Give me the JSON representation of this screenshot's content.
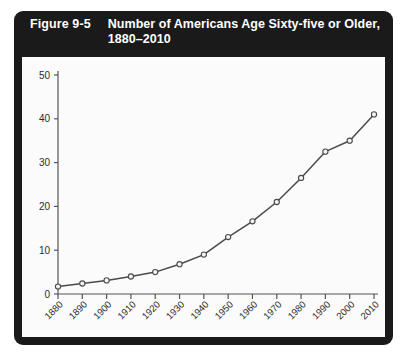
{
  "figure": {
    "number_label": "Figure 9-5",
    "title": "Number of Americans Age Sixty-five or Older, 1880–2010"
  },
  "chart_data": {
    "type": "line",
    "title": "Number of Americans Age Sixty-five or Older, 1880–2010",
    "xlabel": "",
    "ylabel": "",
    "x": [
      1880,
      1890,
      1900,
      1910,
      1920,
      1930,
      1940,
      1950,
      1960,
      1970,
      1980,
      1990,
      2000,
      2010
    ],
    "values": [
      1.7,
      2.4,
      3.1,
      4.0,
      5.0,
      6.8,
      9.0,
      13.0,
      16.6,
      21.0,
      26.5,
      32.5,
      35.0,
      41.0
    ],
    "xtick_labels": [
      "1880",
      "1890",
      "1900",
      "1910",
      "1920",
      "1930",
      "1940",
      "1950",
      "1960",
      "1970",
      "1980",
      "1990",
      "2000",
      "2010"
    ],
    "ytick_labels": [
      "0",
      "10",
      "20",
      "30",
      "40",
      "50"
    ],
    "yticks": [
      0,
      10,
      20,
      30,
      40,
      50
    ],
    "ylim": [
      0,
      50
    ],
    "xlim": [
      1880,
      2010
    ],
    "grid": false,
    "legend": null,
    "marker": "open-circle",
    "line_color": "#4a4a4a",
    "marker_fill": "#f2f2f2",
    "marker_stroke": "#4a4a4a"
  },
  "colors": {
    "frame": "#1a1a1a",
    "title_text": "#ffffff",
    "plot_background": "#fbfbfb",
    "axis": "#555555"
  }
}
